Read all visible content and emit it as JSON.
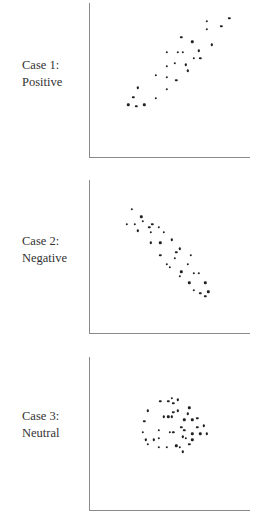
{
  "chart_data": [
    {
      "type": "scatter",
      "title": "Case 1: Positive",
      "label_line1": "Case 1:",
      "label_line2": "Positive",
      "xlabel": "",
      "ylabel": "",
      "xlim": [
        0,
        100
      ],
      "ylim": [
        0,
        100
      ],
      "grid": false,
      "points": [
        [
          87,
          90
        ],
        [
          73,
          88
        ],
        [
          73,
          83
        ],
        [
          82,
          85
        ],
        [
          57,
          78
        ],
        [
          64,
          75
        ],
        [
          76,
          73
        ],
        [
          48,
          68
        ],
        [
          55,
          68
        ],
        [
          58,
          68
        ],
        [
          68,
          69
        ],
        [
          65,
          64
        ],
        [
          69,
          64
        ],
        [
          53,
          61
        ],
        [
          60,
          60
        ],
        [
          48,
          59
        ],
        [
          61,
          56
        ],
        [
          41,
          53
        ],
        [
          48,
          52
        ],
        [
          54,
          50
        ],
        [
          30,
          45
        ],
        [
          48,
          44
        ],
        [
          27,
          39
        ],
        [
          41,
          38
        ],
        [
          24,
          34
        ],
        [
          29,
          33
        ],
        [
          34,
          34
        ]
      ]
    },
    {
      "type": "scatter",
      "title": "Case 2: Negative",
      "label_line1": "Case 2:",
      "label_line2": "Negative",
      "xlabel": "",
      "ylabel": "",
      "xlim": [
        0,
        100
      ],
      "ylim": [
        0,
        100
      ],
      "grid": false,
      "points": [
        [
          26,
          81
        ],
        [
          32,
          76
        ],
        [
          33,
          73
        ],
        [
          23,
          71
        ],
        [
          28,
          71
        ],
        [
          30,
          67
        ],
        [
          37,
          69
        ],
        [
          39,
          71
        ],
        [
          38,
          66
        ],
        [
          43,
          69
        ],
        [
          46,
          66
        ],
        [
          38,
          59
        ],
        [
          44,
          59
        ],
        [
          51,
          61
        ],
        [
          56,
          55
        ],
        [
          54,
          53
        ],
        [
          44,
          51
        ],
        [
          53,
          49
        ],
        [
          63,
          51
        ],
        [
          61,
          45
        ],
        [
          48,
          45
        ],
        [
          50,
          43
        ],
        [
          57,
          40
        ],
        [
          56,
          37
        ],
        [
          65,
          39
        ],
        [
          68,
          39
        ],
        [
          62,
          33
        ],
        [
          72,
          33
        ],
        [
          65,
          28
        ],
        [
          69,
          26
        ],
        [
          74,
          27
        ],
        [
          72,
          24
        ]
      ]
    },
    {
      "type": "scatter",
      "title": "Case 3: Neutral",
      "label_line1": "Case 3:",
      "label_line2": "Neutral",
      "xlabel": "",
      "ylabel": "",
      "xlim": [
        0,
        100
      ],
      "ylim": [
        0,
        100
      ],
      "grid": false,
      "points": [
        [
          44,
          71
        ],
        [
          49,
          71
        ],
        [
          51,
          73
        ],
        [
          55,
          72
        ],
        [
          52,
          70
        ],
        [
          36,
          65
        ],
        [
          62,
          67
        ],
        [
          55,
          65
        ],
        [
          52,
          64
        ],
        [
          46,
          61
        ],
        [
          49,
          61
        ],
        [
          51,
          61
        ],
        [
          61,
          63
        ],
        [
          59,
          59
        ],
        [
          64,
          59
        ],
        [
          67,
          60
        ],
        [
          34,
          58
        ],
        [
          57,
          54
        ],
        [
          71,
          55
        ],
        [
          67,
          54
        ],
        [
          59,
          52
        ],
        [
          43,
          52
        ],
        [
          50,
          51
        ],
        [
          52,
          51
        ],
        [
          33,
          51
        ],
        [
          64,
          50
        ],
        [
          69,
          50
        ],
        [
          73,
          50
        ],
        [
          58,
          48
        ],
        [
          60,
          47
        ],
        [
          64,
          46
        ],
        [
          35,
          46
        ],
        [
          43,
          47
        ],
        [
          40,
          46
        ],
        [
          36,
          43
        ],
        [
          62,
          43
        ],
        [
          43,
          41
        ],
        [
          48,
          41
        ],
        [
          54,
          42
        ],
        [
          56,
          41
        ],
        [
          58,
          38
        ]
      ]
    }
  ]
}
